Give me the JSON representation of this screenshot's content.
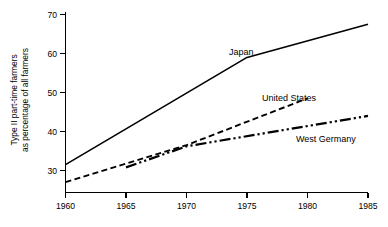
{
  "chart_data": {
    "type": "line",
    "title": "",
    "xlabel": "",
    "ylabel": "Type II part-time farmers as percentage of all farmers",
    "ylabel_line1": "Type II part-time farmers",
    "ylabel_line2": "as percentage of all farmers",
    "xlim": [
      1960,
      1985
    ],
    "ylim": [
      26,
      70
    ],
    "grid": false,
    "legend_position": "inline-annotations",
    "xticks": [
      1960,
      1965,
      1970,
      1975,
      1980,
      1985
    ],
    "xtick_labels": [
      "1960",
      "1965",
      "1970",
      "1975",
      "1980",
      "1985"
    ],
    "yticks": [
      30,
      40,
      50,
      60,
      70
    ],
    "ytick_labels": [
      "30",
      "40",
      "50",
      "60",
      "70"
    ],
    "series": [
      {
        "name": "Japan",
        "label": "Japan",
        "style": "solid",
        "color": "#000000",
        "x": [
          1960,
          1975,
          1985
        ],
        "values": [
          31.5,
          59.0,
          67.5
        ]
      },
      {
        "name": "United States",
        "label": "United States",
        "style": "dashed",
        "color": "#000000",
        "x": [
          1960,
          1970,
          1980
        ],
        "values": [
          27.0,
          36.5,
          48.5
        ]
      },
      {
        "name": "West Germany",
        "label": "West Germany",
        "style": "dash-dot-dot",
        "color": "#000000",
        "x": [
          1965,
          1970,
          1985
        ],
        "values": [
          30.8,
          36.2,
          44.0
        ]
      }
    ],
    "annotations": [
      {
        "text": "Japan",
        "x": 1975,
        "y": 62.5
      },
      {
        "text": "United States",
        "x": 1977,
        "y": 51.5
      },
      {
        "text": "West Germany",
        "x": 1981,
        "y": 40.5
      }
    ]
  },
  "axis": {
    "y_title_line1": "Type II part-time farmers",
    "y_title_line2": "as percentage of all farmers",
    "y_ticks": [
      "70",
      "60",
      "50",
      "40",
      "30"
    ],
    "x_ticks": [
      "1960",
      "1965",
      "1970",
      "1975",
      "1980",
      "1985"
    ]
  },
  "labels": {
    "japan": "Japan",
    "united_states": "United States",
    "west_germany": "West Germany"
  }
}
